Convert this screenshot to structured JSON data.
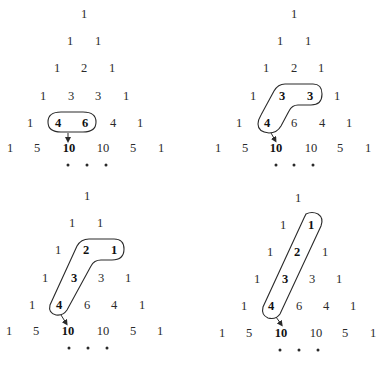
{
  "figure": {
    "ellipsis": "...",
    "panels": [
      {
        "id": "top-left",
        "rows": [
          [
            {
              "v": "1",
              "x": 84,
              "y": 13
            }
          ],
          [
            {
              "v": "1",
              "x": 70,
              "y": 40
            },
            {
              "v": "1",
              "x": 98,
              "y": 40
            }
          ],
          [
            {
              "v": "1",
              "x": 57,
              "y": 67
            },
            {
              "v": "2",
              "x": 84,
              "y": 67
            },
            {
              "v": "1",
              "x": 112,
              "y": 67
            }
          ],
          [
            {
              "v": "1",
              "x": 43,
              "y": 95
            },
            {
              "v": "3",
              "x": 71,
              "y": 95
            },
            {
              "v": "3",
              "x": 98,
              "y": 95
            },
            {
              "v": "1",
              "x": 126,
              "y": 95
            }
          ],
          [
            {
              "v": "1",
              "x": 30,
              "y": 122
            },
            {
              "v": "4",
              "x": 58,
              "y": 122,
              "b": 1
            },
            {
              "v": "6",
              "x": 85,
              "y": 122,
              "b": 1
            },
            {
              "v": "4",
              "x": 113,
              "y": 122
            },
            {
              "v": "1",
              "x": 140,
              "y": 122
            }
          ],
          [
            {
              "v": "1",
              "x": 10,
              "y": 147
            },
            {
              "v": "5",
              "x": 37,
              "y": 147
            },
            {
              "v": "10",
              "x": 69,
              "y": 147,
              "b": 1
            },
            {
              "v": "10",
              "x": 103,
              "y": 147
            },
            {
              "v": "5",
              "x": 133,
              "y": 147
            },
            {
              "v": "1",
              "x": 161,
              "y": 147
            }
          ]
        ],
        "dots": [
          {
            "x": 68,
            "y": 165
          },
          {
            "x": 87,
            "y": 165
          },
          {
            "x": 106,
            "y": 165
          }
        ],
        "loop_path": "M 61 112 L 83 112 Q 96 112 96 122 Q 96 132 83 132 L 61 132 Q 48 132 48 122 Q 48 112 61 112 Z",
        "arrow": {
          "x1": 68,
          "y1": 133,
          "x2": 68,
          "y2": 140
        }
      },
      {
        "id": "top-right",
        "rows": [
          [
            {
              "v": "1",
              "x": 294,
              "y": 13
            }
          ],
          [
            {
              "v": "1",
              "x": 280,
              "y": 40
            },
            {
              "v": "1",
              "x": 308,
              "y": 40
            }
          ],
          [
            {
              "v": "1",
              "x": 266,
              "y": 67
            },
            {
              "v": "2",
              "x": 294,
              "y": 67
            },
            {
              "v": "1",
              "x": 321,
              "y": 67
            }
          ],
          [
            {
              "v": "1",
              "x": 253,
              "y": 95
            },
            {
              "v": "3",
              "x": 282,
              "y": 95,
              "b": 1
            },
            {
              "v": "3",
              "x": 310,
              "y": 95,
              "b": 1
            },
            {
              "v": "1",
              "x": 337,
              "y": 95
            }
          ],
          [
            {
              "v": "1",
              "x": 239,
              "y": 122
            },
            {
              "v": "4",
              "x": 267,
              "y": 122,
              "b": 1
            },
            {
              "v": "6",
              "x": 294,
              "y": 122
            },
            {
              "v": "4",
              "x": 322,
              "y": 122
            },
            {
              "v": "1",
              "x": 349,
              "y": 122
            }
          ],
          [
            {
              "v": "1",
              "x": 218,
              "y": 147
            },
            {
              "v": "5",
              "x": 245,
              "y": 147
            },
            {
              "v": "10",
              "x": 276,
              "y": 147,
              "b": 1
            },
            {
              "v": "10",
              "x": 311,
              "y": 147
            },
            {
              "v": "5",
              "x": 340,
              "y": 147
            },
            {
              "v": "1",
              "x": 368,
              "y": 147
            }
          ]
        ],
        "dots": [
          {
            "x": 276,
            "y": 165
          },
          {
            "x": 294,
            "y": 165
          },
          {
            "x": 313,
            "y": 165
          }
        ],
        "loop_path": "M 285 84 L 313 84 Q 322 84 322 94 Q 322 105 311 105 L 298 105 Q 292 105 289 111 L 281 126 Q 277 133 269 133 Q 258 132 258 124 Q 258 120 261 115 L 274 91 Q 278 84 285 84 Z",
        "arrow": {
          "x1": 271,
          "y1": 133,
          "x2": 275,
          "y2": 140
        }
      },
      {
        "id": "bottom-left",
        "rows": [
          [
            {
              "v": "1",
              "x": 87,
              "y": 195
            }
          ],
          [
            {
              "v": "1",
              "x": 72,
              "y": 222
            },
            {
              "v": "1",
              "x": 100,
              "y": 222
            }
          ],
          [
            {
              "v": "1",
              "x": 58,
              "y": 249
            },
            {
              "v": "2",
              "x": 86,
              "y": 249,
              "b": 1
            },
            {
              "v": "1",
              "x": 114,
              "y": 249,
              "b": 1
            }
          ],
          [
            {
              "v": "1",
              "x": 45,
              "y": 277
            },
            {
              "v": "3",
              "x": 74,
              "y": 277,
              "b": 1
            },
            {
              "v": "3",
              "x": 101,
              "y": 277
            },
            {
              "v": "1",
              "x": 128,
              "y": 277
            }
          ],
          [
            {
              "v": "1",
              "x": 32,
              "y": 304
            },
            {
              "v": "4",
              "x": 59,
              "y": 304,
              "b": 1
            },
            {
              "v": "6",
              "x": 87,
              "y": 304
            },
            {
              "v": "4",
              "x": 114,
              "y": 304
            },
            {
              "v": "1",
              "x": 142,
              "y": 304
            }
          ],
          [
            {
              "v": "1",
              "x": 9,
              "y": 330
            },
            {
              "v": "5",
              "x": 36,
              "y": 330
            },
            {
              "v": "10",
              "x": 68,
              "y": 330,
              "b": 1
            },
            {
              "v": "10",
              "x": 103,
              "y": 330
            },
            {
              "v": "5",
              "x": 133,
              "y": 330
            },
            {
              "v": "1",
              "x": 160,
              "y": 330
            }
          ]
        ],
        "dots": [
          {
            "x": 69,
            "y": 348
          },
          {
            "x": 88,
            "y": 348
          },
          {
            "x": 107,
            "y": 348
          }
        ],
        "loop_path": "M 89 239 L 114 239 Q 124 239 124 249 Q 124 260 112 260 L 101 260 Q 94 260 91 266 L 67 310 Q 63 316 56 315 Q 48 313 50 305 L 77 246 Q 81 239 89 239 Z",
        "arrow": {
          "x1": 61,
          "y1": 315,
          "x2": 66,
          "y2": 323
        }
      },
      {
        "id": "bottom-right",
        "rows": [
          [
            {
              "v": "1",
              "x": 298,
              "y": 197
            }
          ],
          [
            {
              "v": "1",
              "x": 283,
              "y": 224
            },
            {
              "v": "1",
              "x": 311,
              "y": 224,
              "b": 1
            }
          ],
          [
            {
              "v": "1",
              "x": 270,
              "y": 251
            },
            {
              "v": "2",
              "x": 297,
              "y": 251,
              "b": 1
            },
            {
              "v": "1",
              "x": 325,
              "y": 251
            }
          ],
          [
            {
              "v": "1",
              "x": 257,
              "y": 278
            },
            {
              "v": "3",
              "x": 285,
              "y": 278,
              "b": 1
            },
            {
              "v": "3",
              "x": 312,
              "y": 278
            },
            {
              "v": "1",
              "x": 339,
              "y": 278
            }
          ],
          [
            {
              "v": "1",
              "x": 244,
              "y": 305
            },
            {
              "v": "4",
              "x": 271,
              "y": 305,
              "b": 1
            },
            {
              "v": "6",
              "x": 299,
              "y": 305
            },
            {
              "v": "4",
              "x": 326,
              "y": 305
            },
            {
              "v": "1",
              "x": 353,
              "y": 305
            }
          ],
          [
            {
              "v": "1",
              "x": 222,
              "y": 332
            },
            {
              "v": "5",
              "x": 249,
              "y": 332
            },
            {
              "v": "10",
              "x": 281,
              "y": 332,
              "b": 1
            },
            {
              "v": "10",
              "x": 316,
              "y": 332
            },
            {
              "v": "5",
              "x": 345,
              "y": 332
            },
            {
              "v": "1",
              "x": 373,
              "y": 332
            }
          ]
        ],
        "dots": [
          {
            "x": 280,
            "y": 350
          },
          {
            "x": 299,
            "y": 350
          },
          {
            "x": 318,
            "y": 350
          }
        ],
        "loop_path": "M 306 214 Q 312 211 318 214 Q 324 218 321 226 L 280 314 Q 276 320 268 318 Q 261 315 263 307 L 304 218 Z",
        "arrow": {
          "x1": 276,
          "y1": 317,
          "x2": 281,
          "y2": 324
        }
      }
    ]
  },
  "colors": {
    "ink": "#2a2a2a",
    "background": "#ffffff"
  }
}
